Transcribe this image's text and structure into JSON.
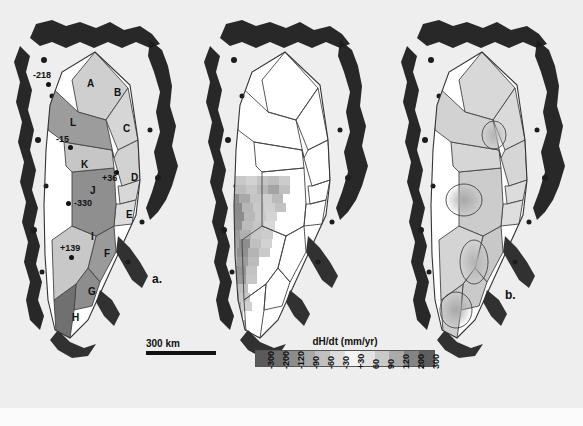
{
  "figure": {
    "background_color": "#eeeeee",
    "ice_fill_color": "#ffffff",
    "land_color": "#1a1a1a",
    "outline_color": "#333333"
  },
  "panels": [
    {
      "id": "a",
      "label": "a.",
      "caption_label": "a."
    },
    {
      "id": "b",
      "label": "b.",
      "caption_label": "b."
    },
    {
      "id": "c",
      "label": "c.",
      "caption_label": "c."
    }
  ],
  "panel_a": {
    "label": "a.",
    "basins": [
      {
        "letter": "A",
        "x": 87,
        "y": 79,
        "shade": "#cfcfcf"
      },
      {
        "letter": "B",
        "x": 114,
        "y": 88,
        "shade": "#d6d6d6"
      },
      {
        "letter": "C",
        "x": 123,
        "y": 124,
        "shade": "#d2d2d2"
      },
      {
        "letter": "D",
        "x": 131,
        "y": 173,
        "shade": "#d8d8d8"
      },
      {
        "letter": "E",
        "x": 126,
        "y": 210,
        "shade": "#dcdcdc"
      },
      {
        "letter": "F",
        "x": 104,
        "y": 249,
        "shade": "#9a9a9a"
      },
      {
        "letter": "G",
        "x": 88,
        "y": 287,
        "shade": "#8d8d8d"
      },
      {
        "letter": "H",
        "x": 72,
        "y": 313,
        "shade": "#707070"
      },
      {
        "letter": "I",
        "x": 91,
        "y": 232,
        "shade": "#c8c8c8"
      },
      {
        "letter": "J",
        "x": 90,
        "y": 186,
        "shade": "#8f8f8f"
      },
      {
        "letter": "K",
        "x": 81,
        "y": 160,
        "shade": "#c6c6c6"
      },
      {
        "letter": "L",
        "x": 70,
        "y": 118,
        "shade": "#9c9c9c"
      }
    ],
    "point_annotations": [
      {
        "value": "-218",
        "label_x": 33,
        "label_y": 71,
        "dot_x": 46,
        "dot_y": 82
      },
      {
        "value": "-15",
        "label_x": 56,
        "label_y": 135,
        "dot_x": 68,
        "dot_y": 145
      },
      {
        "value": "+36",
        "label_x": 102,
        "label_y": 174,
        "dot_x": 114,
        "dot_y": 170
      },
      {
        "value": "-330",
        "label_x": 74,
        "label_y": 199,
        "dot_x": 69,
        "dot_y": 201
      },
      {
        "value": "+139",
        "label_x": 60,
        "label_y": 244,
        "dot_x": 69,
        "dot_y": 255
      }
    ],
    "scalebar": {
      "text": "300 km",
      "length_px": 70
    }
  },
  "panel_b": {
    "label": "b.",
    "description": "gridded dH/dt cells",
    "grid_cells": [
      {
        "x": 26,
        "y": 176,
        "w": 11,
        "h": 9,
        "shade": "#c0c0c0"
      },
      {
        "x": 37,
        "y": 176,
        "w": 11,
        "h": 9,
        "shade": "#b4b4b4"
      },
      {
        "x": 48,
        "y": 176,
        "w": 11,
        "h": 9,
        "shade": "#c8c8c8"
      },
      {
        "x": 59,
        "y": 176,
        "w": 11,
        "h": 9,
        "shade": "#d2d2d2"
      },
      {
        "x": 70,
        "y": 176,
        "w": 11,
        "h": 9,
        "shade": "#c4c4c4"
      },
      {
        "x": 81,
        "y": 176,
        "w": 11,
        "h": 9,
        "shade": "#bdbdbd"
      },
      {
        "x": 92,
        "y": 176,
        "w": 11,
        "h": 9,
        "shade": "#cccccc"
      },
      {
        "x": 26,
        "y": 185,
        "w": 11,
        "h": 9,
        "shade": "#a8a8a8"
      },
      {
        "x": 37,
        "y": 185,
        "w": 11,
        "h": 9,
        "shade": "#9c9c9c"
      },
      {
        "x": 48,
        "y": 185,
        "w": 11,
        "h": 9,
        "shade": "#bcbcbc"
      },
      {
        "x": 59,
        "y": 185,
        "w": 11,
        "h": 9,
        "shade": "#c8c8c8"
      },
      {
        "x": 70,
        "y": 185,
        "w": 11,
        "h": 9,
        "shade": "#b8b8b8"
      },
      {
        "x": 81,
        "y": 185,
        "w": 11,
        "h": 9,
        "shade": "#a4a4a4"
      },
      {
        "x": 92,
        "y": 185,
        "w": 11,
        "h": 9,
        "shade": "#c0c0c0"
      },
      {
        "x": 30,
        "y": 194,
        "w": 11,
        "h": 9,
        "shade": "#b0b0b0"
      },
      {
        "x": 41,
        "y": 194,
        "w": 11,
        "h": 9,
        "shade": "#8f8f8f"
      },
      {
        "x": 52,
        "y": 194,
        "w": 11,
        "h": 9,
        "shade": "#a8a8a8"
      },
      {
        "x": 63,
        "y": 194,
        "w": 11,
        "h": 9,
        "shade": "#c4c4c4"
      },
      {
        "x": 74,
        "y": 194,
        "w": 11,
        "h": 9,
        "shade": "#cfcfcf"
      },
      {
        "x": 85,
        "y": 194,
        "w": 11,
        "h": 9,
        "shade": "#bababa"
      },
      {
        "x": 33,
        "y": 203,
        "w": 11,
        "h": 9,
        "shade": "#a0a0a0"
      },
      {
        "x": 44,
        "y": 203,
        "w": 11,
        "h": 9,
        "shade": "#8a8a8a"
      },
      {
        "x": 55,
        "y": 203,
        "w": 11,
        "h": 9,
        "shade": "#b6b6b6"
      },
      {
        "x": 66,
        "y": 203,
        "w": 11,
        "h": 9,
        "shade": "#c8c8c8"
      },
      {
        "x": 77,
        "y": 203,
        "w": 11,
        "h": 9,
        "shade": "#d0d0d0"
      },
      {
        "x": 88,
        "y": 203,
        "w": 11,
        "h": 9,
        "shade": "#c2c2c2"
      },
      {
        "x": 35,
        "y": 212,
        "w": 11,
        "h": 9,
        "shade": "#9a9a9a"
      },
      {
        "x": 46,
        "y": 212,
        "w": 11,
        "h": 9,
        "shade": "#8c8c8c"
      },
      {
        "x": 57,
        "y": 212,
        "w": 11,
        "h": 9,
        "shade": "#b8b8b8"
      },
      {
        "x": 68,
        "y": 212,
        "w": 11,
        "h": 9,
        "shade": "#cacaca"
      },
      {
        "x": 79,
        "y": 212,
        "w": 11,
        "h": 9,
        "shade": "#d4d4d4"
      },
      {
        "x": 33,
        "y": 221,
        "w": 11,
        "h": 9,
        "shade": "#a6a6a6"
      },
      {
        "x": 44,
        "y": 221,
        "w": 11,
        "h": 9,
        "shade": "#909090"
      },
      {
        "x": 55,
        "y": 221,
        "w": 11,
        "h": 9,
        "shade": "#bcbcbc"
      },
      {
        "x": 66,
        "y": 221,
        "w": 11,
        "h": 9,
        "shade": "#c6c6c6"
      },
      {
        "x": 77,
        "y": 221,
        "w": 11,
        "h": 9,
        "shade": "#d8d8d8"
      },
      {
        "x": 31,
        "y": 230,
        "w": 11,
        "h": 9,
        "shade": "#b2b2b2"
      },
      {
        "x": 42,
        "y": 230,
        "w": 11,
        "h": 9,
        "shade": "#9a9a9a"
      },
      {
        "x": 53,
        "y": 230,
        "w": 11,
        "h": 9,
        "shade": "#b0b0b0"
      },
      {
        "x": 64,
        "y": 230,
        "w": 11,
        "h": 9,
        "shade": "#c8c8c8"
      },
      {
        "x": 75,
        "y": 230,
        "w": 11,
        "h": 9,
        "shade": "#cccccc"
      },
      {
        "x": 30,
        "y": 239,
        "w": 11,
        "h": 9,
        "shade": "#bebebe"
      },
      {
        "x": 41,
        "y": 239,
        "w": 11,
        "h": 9,
        "shade": "#a2a2a2"
      },
      {
        "x": 52,
        "y": 239,
        "w": 11,
        "h": 9,
        "shade": "#8e8e8e"
      },
      {
        "x": 63,
        "y": 239,
        "w": 11,
        "h": 9,
        "shade": "#c0c0c0"
      },
      {
        "x": 74,
        "y": 239,
        "w": 11,
        "h": 9,
        "shade": "#d2d2d2"
      },
      {
        "x": 28,
        "y": 248,
        "w": 11,
        "h": 9,
        "shade": "#c4c4c4"
      },
      {
        "x": 39,
        "y": 248,
        "w": 11,
        "h": 9,
        "shade": "#aeaeae"
      },
      {
        "x": 50,
        "y": 248,
        "w": 11,
        "h": 9,
        "shade": "#909090"
      },
      {
        "x": 61,
        "y": 248,
        "w": 11,
        "h": 9,
        "shade": "#b4b4b4"
      },
      {
        "x": 72,
        "y": 248,
        "w": 11,
        "h": 9,
        "shade": "#cacaca"
      },
      {
        "x": 28,
        "y": 257,
        "w": 11,
        "h": 9,
        "shade": "#cccccc"
      },
      {
        "x": 39,
        "y": 257,
        "w": 11,
        "h": 9,
        "shade": "#b8b8b8"
      },
      {
        "x": 50,
        "y": 257,
        "w": 11,
        "h": 9,
        "shade": "#9c9c9c"
      },
      {
        "x": 61,
        "y": 257,
        "w": 11,
        "h": 9,
        "shade": "#bcbcbc"
      },
      {
        "x": 26,
        "y": 266,
        "w": 11,
        "h": 9,
        "shade": "#c8c8c8"
      },
      {
        "x": 37,
        "y": 266,
        "w": 11,
        "h": 9,
        "shade": "#a6a6a6"
      },
      {
        "x": 48,
        "y": 266,
        "w": 11,
        "h": 9,
        "shade": "#949494"
      },
      {
        "x": 59,
        "y": 266,
        "w": 11,
        "h": 9,
        "shade": "#c2c2c2"
      },
      {
        "x": 26,
        "y": 275,
        "w": 11,
        "h": 9,
        "shade": "#d0d0d0"
      },
      {
        "x": 37,
        "y": 275,
        "w": 11,
        "h": 9,
        "shade": "#b0b0b0"
      },
      {
        "x": 48,
        "y": 275,
        "w": 11,
        "h": 9,
        "shade": "#9a9a9a"
      },
      {
        "x": 59,
        "y": 275,
        "w": 11,
        "h": 9,
        "shade": "#c6c6c6"
      },
      {
        "x": 28,
        "y": 284,
        "w": 11,
        "h": 9,
        "shade": "#cacaca"
      },
      {
        "x": 39,
        "y": 284,
        "w": 11,
        "h": 9,
        "shade": "#a8a8a8"
      },
      {
        "x": 50,
        "y": 284,
        "w": 11,
        "h": 9,
        "shade": "#bebebe"
      },
      {
        "x": 30,
        "y": 293,
        "w": 11,
        "h": 9,
        "shade": "#c0c0c0"
      },
      {
        "x": 41,
        "y": 293,
        "w": 11,
        "h": 9,
        "shade": "#9e9e9e"
      },
      {
        "x": 52,
        "y": 293,
        "w": 11,
        "h": 9,
        "shade": "#c8c8c8"
      },
      {
        "x": 32,
        "y": 302,
        "w": 11,
        "h": 9,
        "shade": "#bcbcbc"
      },
      {
        "x": 43,
        "y": 302,
        "w": 11,
        "h": 9,
        "shade": "#a4a4a4"
      },
      {
        "x": 54,
        "y": 302,
        "w": 11,
        "h": 9,
        "shade": "#d0d0d0"
      },
      {
        "x": 34,
        "y": 311,
        "w": 11,
        "h": 9,
        "shade": "#c6c6c6"
      },
      {
        "x": 45,
        "y": 311,
        "w": 11,
        "h": 9,
        "shade": "#b2b2b2"
      },
      {
        "x": 36,
        "y": 320,
        "w": 11,
        "h": 9,
        "shade": "#cccccc"
      },
      {
        "x": 47,
        "y": 320,
        "w": 11,
        "h": 9,
        "shade": "#bababa"
      },
      {
        "x": 38,
        "y": 329,
        "w": 11,
        "h": 9,
        "shade": "#d4d4d4"
      },
      {
        "x": 49,
        "y": 329,
        "w": 11,
        "h": 9,
        "shade": "#c4c4c4"
      }
    ]
  },
  "panel_c": {
    "label": "c.",
    "description": "interpolated dH/dt surface",
    "basin_shades": [
      {
        "letter": "A",
        "shade": "#d8d8d8"
      },
      {
        "letter": "B",
        "shade": "#dadada"
      },
      {
        "letter": "C",
        "shade": "#d6d6d6"
      },
      {
        "letter": "D",
        "shade": "#dcdcdc"
      },
      {
        "letter": "E",
        "shade": "#dedede"
      },
      {
        "letter": "F",
        "shade": "#c8c8c8"
      },
      {
        "letter": "G",
        "shade": "#cacaca"
      },
      {
        "letter": "H",
        "shade": "#cecece"
      },
      {
        "letter": "I",
        "shade": "#d4d4d4"
      },
      {
        "letter": "J",
        "shade": "#cccccc"
      },
      {
        "letter": "K",
        "shade": "#d6d6d6"
      },
      {
        "letter": "L",
        "shade": "#d2d2d2"
      }
    ]
  },
  "chart_data": {
    "type": "heatmap",
    "title": "dH/dt (mm/yr)",
    "xlabel": "",
    "ylabel": "",
    "colorbar": {
      "title": "dH/dt (mm/yr)",
      "tick_labels": [
        "-300",
        "-200",
        "-120",
        "-90",
        "-60",
        "-30",
        "+30",
        "60",
        "90",
        "120",
        "200",
        "300"
      ],
      "tick_values": [
        -300,
        -200,
        -120,
        -90,
        -60,
        -30,
        30,
        60,
        90,
        120,
        200,
        300
      ],
      "colors": [
        "#5a5a5a",
        "#6e6e6e",
        "#8c8c8c",
        "#a8a8a8",
        "#c0c0c0",
        "#dcdcdc",
        "#f4f4f4",
        "#e2e2e2",
        "#c8c8c8",
        "#aaaaaa",
        "#848484",
        "#5e5e5e"
      ],
      "orientation": "horizontal",
      "position": "bottom-center"
    },
    "panels": [
      {
        "id": "a",
        "label": "a.",
        "type": "map",
        "description": "Greenland drainage basins A-L with in-situ dH/dt point measurements",
        "categories": [
          "A",
          "B",
          "C",
          "D",
          "E",
          "F",
          "G",
          "H",
          "I",
          "J",
          "K",
          "L"
        ],
        "point_values": [
          -218,
          -15,
          36,
          -330,
          139
        ],
        "point_labels": [
          "-218",
          "-15",
          "+36",
          "-330",
          "+139"
        ],
        "scalebar": "300 km"
      },
      {
        "id": "b",
        "label": "b.",
        "type": "map",
        "description": "Gridded dH/dt cells over southern Greenland; northern basins unfilled"
      },
      {
        "id": "c",
        "label": "c.",
        "type": "map",
        "description": "Interpolated dH/dt surface over all drainage basins"
      }
    ]
  }
}
